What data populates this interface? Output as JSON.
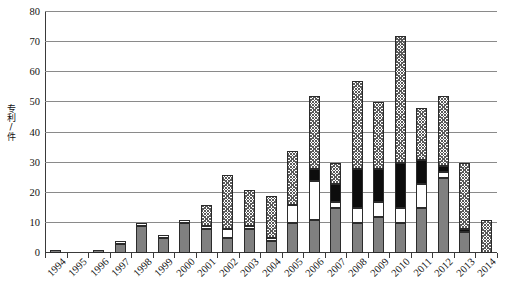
{
  "chart_data": {
    "type": "bar",
    "title": "",
    "subtitle": "",
    "xlabel": "",
    "ylabel": "专利/件",
    "ylim": [
      0,
      80
    ],
    "ytick_labels": [
      "0",
      "10",
      "20",
      "30",
      "40",
      "50",
      "60",
      "70",
      "80"
    ],
    "ytick_values": [
      0,
      10,
      20,
      30,
      40,
      50,
      60,
      70,
      80
    ],
    "grid": true,
    "grid_axis": "y",
    "legend": null,
    "legend_position": "none",
    "stacked": true,
    "categories": [
      "1994",
      "1995",
      "1996",
      "1997",
      "1998",
      "1999",
      "2000",
      "2001",
      "2002",
      "2003",
      "2004",
      "2005",
      "2006",
      "2007",
      "2008",
      "2009",
      "2010",
      "2011",
      "2012",
      "2013",
      "2014"
    ],
    "series": [
      {
        "name": "segment-1-gray",
        "style": "gray-solid",
        "color": "#808080",
        "values": [
          1,
          0,
          1,
          3,
          9,
          5,
          10,
          8,
          5,
          8,
          4,
          10,
          11,
          15,
          10,
          12,
          10,
          15,
          25,
          7,
          0
        ]
      },
      {
        "name": "segment-2-white",
        "style": "white-solid",
        "color": "#ffffff",
        "values": [
          0,
          0,
          0,
          1,
          1,
          1,
          1,
          1,
          3,
          1,
          1,
          6,
          13,
          2,
          5,
          5,
          5,
          8,
          2,
          0,
          0
        ]
      },
      {
        "name": "segment-3-black",
        "style": "black-solid",
        "color": "#0d0d0d",
        "values": [
          0,
          0,
          0,
          0,
          0,
          0,
          0,
          0,
          0,
          0,
          0,
          0,
          4,
          6,
          13,
          11,
          15,
          8,
          2,
          1,
          0
        ]
      },
      {
        "name": "segment-4-hatch",
        "style": "crosshatch",
        "color": "#5a5a5a",
        "values": [
          0,
          0,
          0,
          0,
          0,
          0,
          0,
          7,
          18,
          12,
          14,
          18,
          24,
          7,
          29,
          22,
          42,
          17,
          23,
          22,
          11
        ]
      }
    ],
    "totals": [
      1,
      0,
      1,
      4,
      10,
      6,
      11,
      16,
      26,
      21,
      19,
      34,
      52,
      30,
      57,
      50,
      72,
      48,
      52,
      30,
      11
    ]
  }
}
